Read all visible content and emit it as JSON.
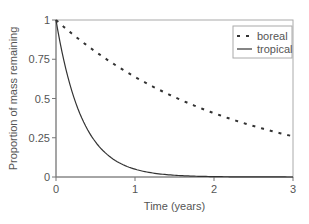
{
  "chart_data": {
    "type": "line",
    "title": "",
    "xlabel": "Time (years)",
    "ylabel": "Proportion of mass remaining",
    "xlim": [
      0,
      3
    ],
    "ylim": [
      0,
      1
    ],
    "x_ticks": [
      "0",
      "1",
      "2",
      "3"
    ],
    "y_ticks": [
      "0",
      "0.25",
      "0.5",
      "0.75",
      "1"
    ],
    "grid": false,
    "legend_position": "upper right",
    "x": [
      0,
      0.25,
      0.5,
      0.75,
      1,
      1.25,
      1.5,
      1.75,
      2,
      2.25,
      2.5,
      2.75,
      3
    ],
    "series": [
      {
        "name": "boreal",
        "style": "dashed",
        "values": [
          1.0,
          0.89,
          0.8,
          0.71,
          0.64,
          0.57,
          0.51,
          0.46,
          0.41,
          0.36,
          0.32,
          0.29,
          0.26
        ]
      },
      {
        "name": "tropical",
        "style": "solid",
        "values": [
          1.0,
          0.47,
          0.22,
          0.11,
          0.05,
          0.02,
          0.01,
          0.005,
          0.002,
          0.001,
          0.0,
          0.0,
          0.0
        ]
      }
    ]
  },
  "legend": {
    "items": [
      "boreal",
      "tropical"
    ]
  }
}
